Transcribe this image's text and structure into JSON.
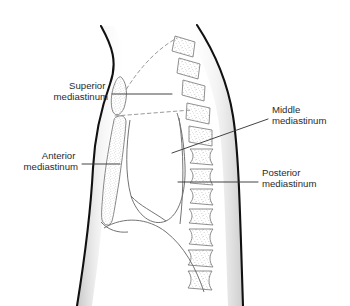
{
  "figure": {
    "name": "mediastinum-divisions-lateral-view",
    "background_color": "#ffffff",
    "outline_color": "#111111",
    "structure_line_color": "#6b6b6b",
    "leader_line_color": "#3a3a3a",
    "stipple_color": "#8a8a8a",
    "text_color": "#2b2b2b"
  },
  "labels": [
    {
      "id": "superior",
      "line1": "Superior",
      "line2": "mediastinum",
      "align": "right",
      "text_x": 108,
      "text_y": 89,
      "leader": {
        "x1": 112,
        "y1": 94,
        "x2": 172,
        "y2": 94
      }
    },
    {
      "id": "anterior",
      "line1": "Anterior",
      "line2": "mediastinum",
      "align": "right",
      "text_x": 78,
      "text_y": 159,
      "leader": {
        "x1": 82,
        "y1": 164,
        "x2": 120,
        "y2": 164
      }
    },
    {
      "id": "middle",
      "line1": "Middle",
      "line2": "mediastinum",
      "align": "left",
      "text_x": 272,
      "text_y": 113,
      "leader": {
        "x1": 268,
        "y1": 119,
        "x2": 172,
        "y2": 153
      }
    },
    {
      "id": "posterior",
      "line1": "Posterior",
      "line2": "mediastinum",
      "align": "left",
      "text_x": 262,
      "text_y": 176,
      "leader": {
        "x1": 258,
        "y1": 182,
        "x2": 178,
        "y2": 182
      }
    }
  ],
  "regions": {
    "superior_mediastinum": {
      "name": "superior-mediastinum-region",
      "shape": "stippled-oval"
    },
    "anterior_mediastinum": {
      "name": "anterior-mediastinum-region",
      "shape": "stippled-crescent"
    },
    "middle_mediastinum": {
      "name": "middle-mediastinum-region",
      "shape": "pericardial-outline"
    },
    "posterior_mediastinum": {
      "name": "posterior-mediastinum-region",
      "shape": "prevertebral-space"
    }
  },
  "anatomy": {
    "body_outline": "thoracic-trunk-lateral-silhouette",
    "vertebral_column": "thoracic-vertebrae-stippled",
    "vertebra_count": 12,
    "heart": "pericardium-outline",
    "diaphragm": "diaphragm-dome",
    "boundary_lines": [
      {
        "id": "thoracic-inlet",
        "style": "dashed"
      },
      {
        "id": "sternal-angle-plane",
        "style": "dashed"
      }
    ]
  }
}
